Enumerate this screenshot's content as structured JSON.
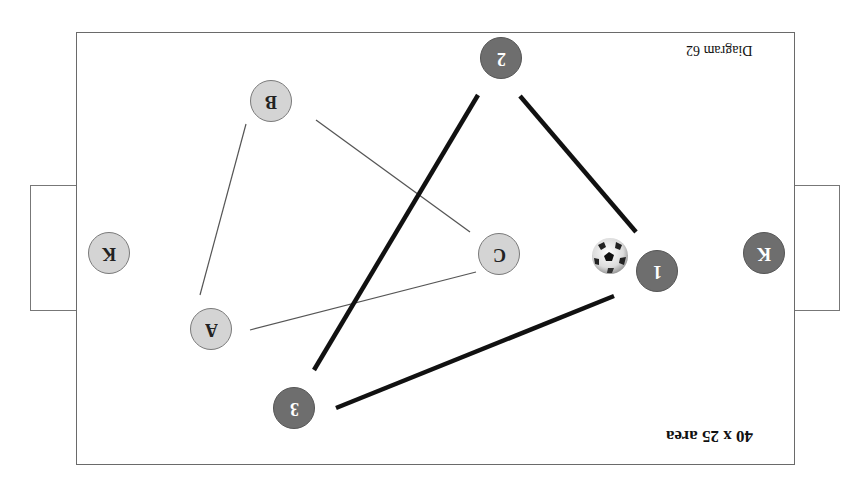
{
  "diagram": {
    "title": "40 x 25 area",
    "diagram_label": "Diagram 62",
    "orientation": "rotated 180 degrees",
    "colors": {
      "light_team": "#d4d4d4",
      "dark_team": "#6e6e6e",
      "field_border": "#6a6a6a",
      "pass_line_dark": "#111111",
      "pass_line_light": "#555555"
    },
    "players": {
      "light": [
        {
          "id": "K",
          "label": "K"
        },
        {
          "id": "A",
          "label": "A"
        },
        {
          "id": "B",
          "label": "B"
        },
        {
          "id": "C",
          "label": "C"
        }
      ],
      "dark": [
        {
          "id": "K",
          "label": "K"
        },
        {
          "id": "1",
          "label": "1"
        },
        {
          "id": "2",
          "label": "2"
        },
        {
          "id": "3",
          "label": "3"
        }
      ]
    },
    "connections": {
      "light": [
        [
          "A",
          "B"
        ],
        [
          "B",
          "C"
        ],
        [
          "C",
          "A"
        ]
      ],
      "dark": [
        [
          "1",
          "2"
        ],
        [
          "2",
          "3"
        ],
        [
          "3",
          "1"
        ]
      ]
    },
    "ball": {
      "near": "1",
      "icon": "soccer-ball-icon"
    }
  }
}
